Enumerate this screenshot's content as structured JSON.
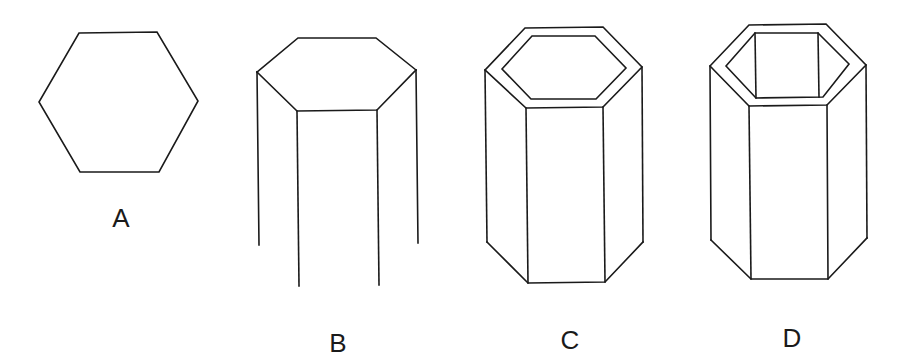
{
  "figures": [
    {
      "id": "A",
      "label": "A",
      "description": "Regular hexagon (flat top/bottom)"
    },
    {
      "id": "B",
      "label": "B",
      "description": "Hexagonal top face with four vertical edges extending downward, open bottom"
    },
    {
      "id": "C",
      "label": "C",
      "description": "Hollow hexagonal prism with inner hexagon rim on top"
    },
    {
      "id": "D",
      "label": "D",
      "description": "Hollow hexagonal prism with visible inner walls"
    }
  ],
  "colors": {
    "line": "#1a1a1a",
    "background": "#ffffff"
  }
}
